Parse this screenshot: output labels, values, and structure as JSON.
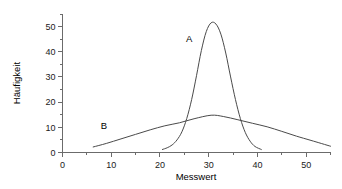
{
  "chart_data": {
    "type": "line",
    "title": "",
    "subtitle": "",
    "xlabel": "Messwert",
    "ylabel": "Häufigkeit",
    "xlim": [
      0,
      55
    ],
    "ylim": [
      0,
      55
    ],
    "grid": false,
    "legend_position": "inline-annotation",
    "x_major_ticks": [
      0,
      10,
      20,
      30,
      40,
      50
    ],
    "x_major_tick_labels": [
      "0",
      "10",
      "20",
      "30",
      "40",
      "50"
    ],
    "x_minor_ticks": [
      5,
      15,
      25,
      35,
      45,
      55
    ],
    "y_major_ticks": [
      0,
      10,
      20,
      30,
      40,
      50
    ],
    "y_major_tick_labels": [
      "0",
      "10",
      "20",
      "30",
      "40",
      "50"
    ],
    "y_minor_ticks": [
      5,
      15,
      25,
      35,
      45,
      55
    ],
    "annotations": [
      {
        "text": "A",
        "x": 26.0,
        "y": 44.0
      },
      {
        "text": "B",
        "x": 8.5,
        "y": 9.5
      }
    ],
    "series": [
      {
        "name": "A",
        "label": "A",
        "color": "#4a4a4a",
        "description": "narrow high peak (low variance distribution)",
        "x": [
          20.5,
          21.5,
          22.5,
          23.5,
          24.5,
          25.5,
          26.5,
          27.5,
          28.5,
          29.5,
          30.5,
          31.5,
          32.5,
          33.5,
          34.5,
          35.5,
          36.5,
          37.5,
          38.5,
          39.5,
          40.8
        ],
        "values": [
          1.2,
          1.9,
          3.0,
          5.0,
          8.2,
          13.5,
          21.0,
          30.5,
          40.5,
          48.0,
          51.5,
          51.0,
          47.0,
          39.5,
          30.0,
          21.0,
          13.5,
          8.0,
          4.5,
          2.4,
          1.2
        ]
      },
      {
        "name": "B",
        "label": "B",
        "color": "#4a4a4a",
        "description": "broad low curve (high variance distribution)",
        "x": [
          6.3,
          9,
          12,
          15,
          18,
          21,
          24,
          27,
          30.5,
          33,
          36,
          39,
          42,
          45,
          48,
          51,
          55
        ],
        "values": [
          2.2,
          3.6,
          5.4,
          7.2,
          9.0,
          10.6,
          11.8,
          13.4,
          14.8,
          14.3,
          13.0,
          11.6,
          10.2,
          8.4,
          6.5,
          4.8,
          2.5
        ]
      }
    ]
  },
  "axes": {
    "x_title": "Messwert",
    "y_title": "Häufigkeit"
  }
}
